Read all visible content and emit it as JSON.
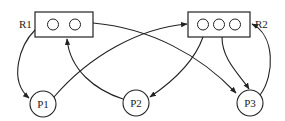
{
  "diagram": {
    "type": "resource-allocation-graph",
    "stroke_color": "#222222",
    "background": "#ffffff",
    "resources": [
      {
        "id": "R1",
        "label": "R1",
        "instances": 2
      },
      {
        "id": "R2",
        "label": "R2",
        "instances": 3
      }
    ],
    "processes": [
      {
        "id": "P1",
        "label": "P1"
      },
      {
        "id": "P2",
        "label": "P2"
      },
      {
        "id": "P3",
        "label": "P3"
      }
    ],
    "edges": [
      {
        "from": "R1",
        "to": "P1",
        "kind": "assignment"
      },
      {
        "from": "R1",
        "to": "P3",
        "kind": "assignment"
      },
      {
        "from": "P1",
        "to": "R2",
        "kind": "request"
      },
      {
        "from": "P2",
        "to": "R1",
        "kind": "request"
      },
      {
        "from": "R2",
        "to": "P2",
        "kind": "assignment"
      },
      {
        "from": "R2",
        "to": "P3",
        "kind": "assignment"
      },
      {
        "from": "P3",
        "to": "R2",
        "kind": "request"
      }
    ]
  }
}
